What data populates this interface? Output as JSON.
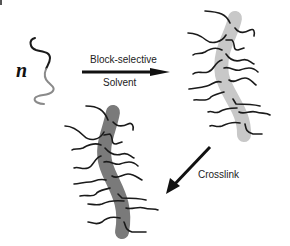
{
  "figure": {
    "unimer": {
      "repeat_label": "n",
      "blocks": [
        {
          "name": "corona-block",
          "color": "#1a1a1a"
        },
        {
          "name": "core-block",
          "color": "#8a8a8a"
        }
      ]
    },
    "steps": [
      {
        "label_line1": "Block-selective",
        "label_line2": "Solvent"
      },
      {
        "label": "Crosslink"
      }
    ],
    "micelles": [
      {
        "name": "uncrosslinked-cylindrical-micelle",
        "core_color": "#c8c8c8",
        "corona_color": "#1a1a1a"
      },
      {
        "name": "crosslinked-cylindrical-micelle",
        "core_color": "#7a7a7a",
        "corona_color": "#1a1a1a"
      }
    ],
    "colors": {
      "arrow": "#111111",
      "text": "#222222",
      "background": "#ffffff"
    }
  }
}
